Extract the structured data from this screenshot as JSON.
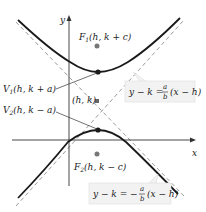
{
  "diagram": {
    "type": "vertical-hyperbola",
    "axes": {
      "x_label": "x",
      "y_label": "y"
    },
    "points": {
      "center": {
        "label": "(h, k)"
      },
      "focus1": {
        "name": "F",
        "sub": "1",
        "coords": "(h, k + c)"
      },
      "focus2": {
        "name": "F",
        "sub": "2",
        "coords": "(h, k − c)"
      },
      "vertex1": {
        "name": "V",
        "sub": "1",
        "coords": "(h, k + a)"
      },
      "vertex2": {
        "name": "V",
        "sub": "2",
        "coords": "(h, k − a)"
      }
    },
    "asymptotes": {
      "positive": {
        "lhs": "y − k =",
        "num": "a",
        "den": "b",
        "rhs": "(x − h)"
      },
      "negative": {
        "lhs": "y − k = −",
        "num": "a",
        "den": "b",
        "rhs": "(x − h)"
      }
    },
    "colors": {
      "curve": "#1a1a1a",
      "asymptote": "#9a9a9a",
      "axis": "#333333",
      "point": "#1a1a1a",
      "center_point": "#666666",
      "focus_point": "#777777",
      "callout_bg": "#f2f2f2",
      "callout_border": "#dddddd"
    }
  }
}
